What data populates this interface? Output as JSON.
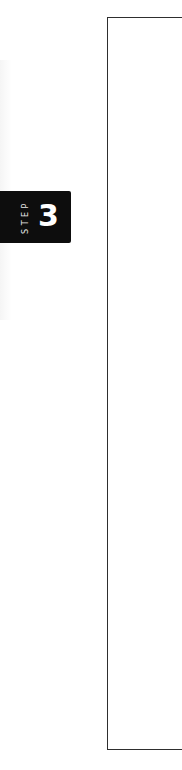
{
  "step_badge": {
    "label": "STEP",
    "number": "3",
    "background_color": "#0d0d0d",
    "text_color": "#ffffff"
  },
  "content_frame": {
    "border_color": "#2e2e2e"
  }
}
